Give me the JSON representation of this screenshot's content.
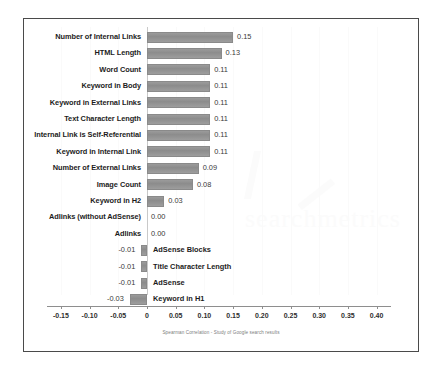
{
  "chart_data": {
    "type": "bar",
    "orientation": "horizontal",
    "title": "",
    "xlabel": "Spearman Correlation - Study of Google search results",
    "ylabel": "",
    "xlim": [
      -0.175,
      0.425
    ],
    "xticks": [
      "-0.15",
      "-0.10",
      "-0.05",
      "0",
      "0.05",
      "0.10",
      "0.15",
      "0.20",
      "0.25",
      "0.30",
      "0.35",
      "0.40"
    ],
    "xtick_values": [
      -0.15,
      -0.1,
      -0.05,
      0,
      0.05,
      0.1,
      0.15,
      0.2,
      0.25,
      0.3,
      0.35,
      0.4
    ],
    "grid": true,
    "legend": false,
    "bar_color": "#8c8c8c",
    "categories": [
      "Number of Internal Links",
      "HTML Length",
      "Word Count",
      "Keyword in Body",
      "Keyword in External Links",
      "Text Character Length",
      "Internal Link is Self-Referential",
      "Keyword in Internal Link",
      "Number of External Links",
      "Image Count",
      "Keyword in H2",
      "Adlinks (without AdSense)",
      "Adlinks",
      "AdSense Blocks",
      "Title Character Length",
      "AdSense",
      "Keyword in H1"
    ],
    "values": [
      0.15,
      0.13,
      0.11,
      0.11,
      0.11,
      0.11,
      0.11,
      0.11,
      0.09,
      0.08,
      0.03,
      0.0,
      0.0,
      -0.01,
      -0.01,
      -0.01,
      -0.03
    ],
    "value_labels": [
      "0.15",
      "0.13",
      "0.11",
      "0.11",
      "0.11",
      "0.11",
      "0.11",
      "0.11",
      "0.09",
      "0.08",
      "0.03",
      "0.00",
      "0.00",
      "-0.01",
      "-0.01",
      "-0.01",
      "-0.03"
    ]
  },
  "caption": "Spearman Correlation - Study of Google search results",
  "watermark": {
    "text": "searchmetrics"
  }
}
